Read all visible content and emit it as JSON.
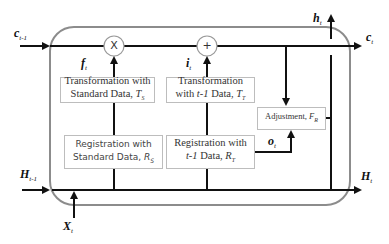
{
  "diagram": {
    "type": "LSTM-style cell block diagram",
    "colors": {
      "line": "#111111",
      "frame": "#8c8c8c",
      "box_border": "#bdbdbd"
    },
    "inputs": {
      "c_prev": {
        "base": "c",
        "sub": "t-1"
      },
      "H_prev": {
        "base": "H",
        "sub": "t-1"
      },
      "X_t": {
        "base": "X",
        "sub": "t"
      }
    },
    "outputs": {
      "c_t": {
        "base": "c",
        "sub": "t"
      },
      "h_t": {
        "base": "h",
        "sub": "t"
      },
      "H_t": {
        "base": "H",
        "sub": "t"
      }
    },
    "gates": {
      "f_t": {
        "base": "f",
        "sub": "t"
      },
      "i_t": {
        "base": "i",
        "sub": "t"
      },
      "o_t": {
        "base": "o",
        "sub": "t"
      }
    },
    "operators": {
      "multiply": "X",
      "add": "+"
    },
    "boxes": {
      "transform_standard": {
        "line1": "Transformation with",
        "line2": "Standard Data, ",
        "sym": "T",
        "sym_sub": "S"
      },
      "transform_prev": {
        "line1": "Transformation",
        "line2_pre": "with ",
        "line2_it": "t-1",
        "line2_post": " Data, ",
        "sym": "T",
        "sym_sub": "T"
      },
      "register_standard": {
        "line1": "Registration with",
        "line2": "Standard Data, ",
        "sym": "R",
        "sym_sub": "S"
      },
      "register_prev": {
        "line1": "Registration with",
        "line2_it": "t-1",
        "line2_post": " Data, ",
        "sym": "R",
        "sym_sub": "T"
      },
      "adjustment": {
        "line1": "Adjustment, ",
        "sym": "F",
        "sym_sub": "R"
      }
    }
  }
}
